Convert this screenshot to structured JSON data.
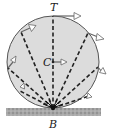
{
  "diagram": {
    "labels": {
      "top": "T",
      "center": "C",
      "bottom": "B"
    },
    "colors": {
      "wheel_fill": "#dcdcdc",
      "wheel_stroke": "#555555",
      "spoke": "#222222",
      "arrow_fill": "#ffffff",
      "arrow_stroke": "#666666",
      "ground": "#9a9a9a"
    },
    "wheel": {
      "cx": 53,
      "cy": 62,
      "r": 46
    },
    "contact_point": {
      "x": 53,
      "y": 108
    },
    "spoke_points": [
      {
        "x": 53,
        "y": 16
      },
      {
        "x": 21,
        "y": 32
      },
      {
        "x": 88,
        "y": 33
      },
      {
        "x": 8,
        "y": 68
      },
      {
        "x": 98,
        "y": 67
      },
      {
        "x": 20,
        "y": 91
      },
      {
        "x": 89,
        "y": 96
      }
    ]
  }
}
